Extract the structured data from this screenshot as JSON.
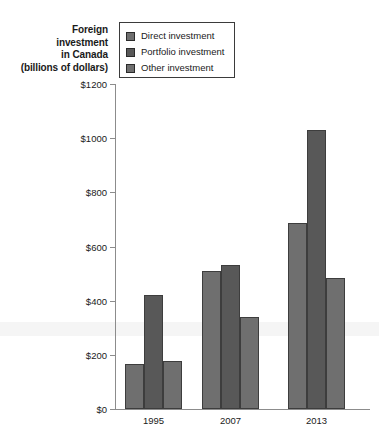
{
  "chart_data": {
    "type": "bar",
    "title": "Foreign investment in Canada (billions of dollars)",
    "title_lines": [
      "Foreign",
      "investment",
      "in Canada",
      "(billions of dollars)"
    ],
    "xlabel": "",
    "ylabel": "Foreign investment in Canada (billions of dollars)",
    "categories": [
      "1995",
      "2007",
      "2013"
    ],
    "series": [
      {
        "name": "Direct investment",
        "values": [
          165,
          510,
          685
        ],
        "color": "#6f6f6f"
      },
      {
        "name": "Portfolio investment",
        "values": [
          420,
          530,
          1030
        ],
        "color": "#585858"
      },
      {
        "name": "Other investment",
        "values": [
          178,
          340,
          485
        ],
        "color": "#6f6f6f"
      }
    ],
    "ylim": [
      0,
      1200
    ],
    "ytick_values": [
      0,
      200,
      400,
      600,
      800,
      1000,
      1200
    ],
    "ytick_labels": [
      "$0",
      "$200",
      "$400",
      "$600",
      "$800",
      "$1000",
      "$1200"
    ],
    "grid": false,
    "legend_position": "top-left"
  },
  "legend": {
    "items": [
      {
        "label": "Direct investment",
        "color": "#6f6f6f"
      },
      {
        "label": "Portfolio investment",
        "color": "#585858"
      },
      {
        "label": "Other investment",
        "color": "#6f6f6f"
      }
    ]
  },
  "colors": {
    "axis": "#8c8c8c",
    "bar_border": "#3d3d3d",
    "legend_border": "#3b3b3b",
    "text": "#1a1a1a"
  }
}
